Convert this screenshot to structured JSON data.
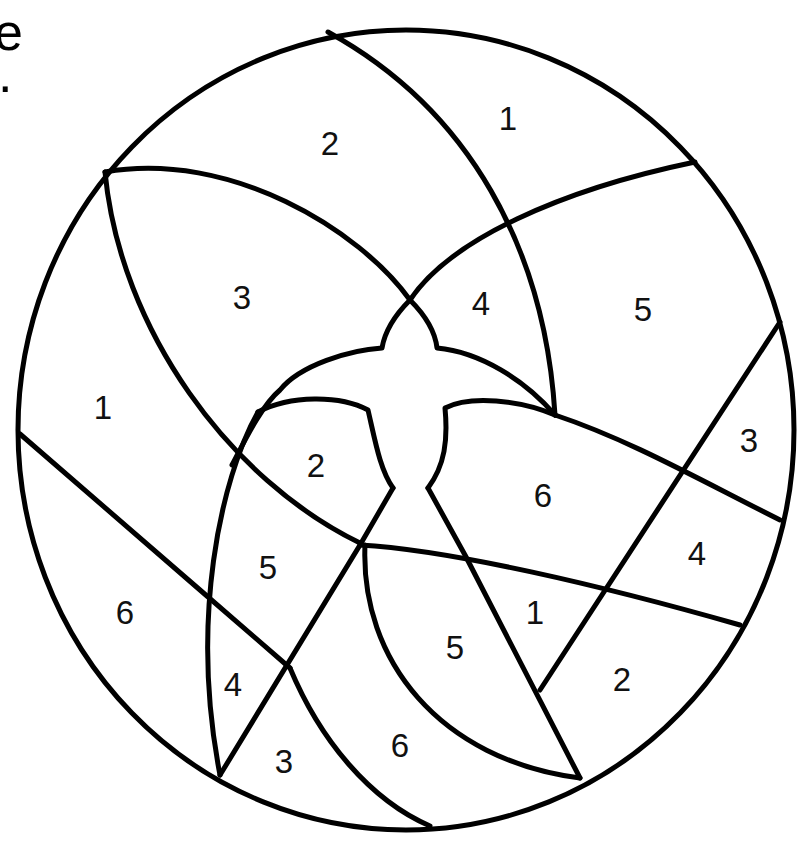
{
  "page": {
    "type": "color-by-number coloring page",
    "background_color": "#ffffff",
    "line_color": "#000000"
  },
  "edge_text": {
    "top_fragment": "e",
    "second_fragment": "."
  },
  "regions": [
    {
      "number": "1",
      "x": 508,
      "y": 118
    },
    {
      "number": "2",
      "x": 330,
      "y": 143
    },
    {
      "number": "3",
      "x": 242,
      "y": 297
    },
    {
      "number": "4",
      "x": 481,
      "y": 303
    },
    {
      "number": "5",
      "x": 643,
      "y": 309
    },
    {
      "number": "1",
      "x": 103,
      "y": 407
    },
    {
      "number": "3",
      "x": 749,
      "y": 440
    },
    {
      "number": "2",
      "x": 316,
      "y": 465
    },
    {
      "number": "6",
      "x": 543,
      "y": 495
    },
    {
      "number": "4",
      "x": 697,
      "y": 553
    },
    {
      "number": "5",
      "x": 268,
      "y": 567
    },
    {
      "number": "6",
      "x": 125,
      "y": 612
    },
    {
      "number": "1",
      "x": 535,
      "y": 612
    },
    {
      "number": "5",
      "x": 455,
      "y": 647
    },
    {
      "number": "2",
      "x": 622,
      "y": 679
    },
    {
      "number": "4",
      "x": 233,
      "y": 684
    },
    {
      "number": "6",
      "x": 400,
      "y": 745
    },
    {
      "number": "3",
      "x": 284,
      "y": 761
    }
  ]
}
